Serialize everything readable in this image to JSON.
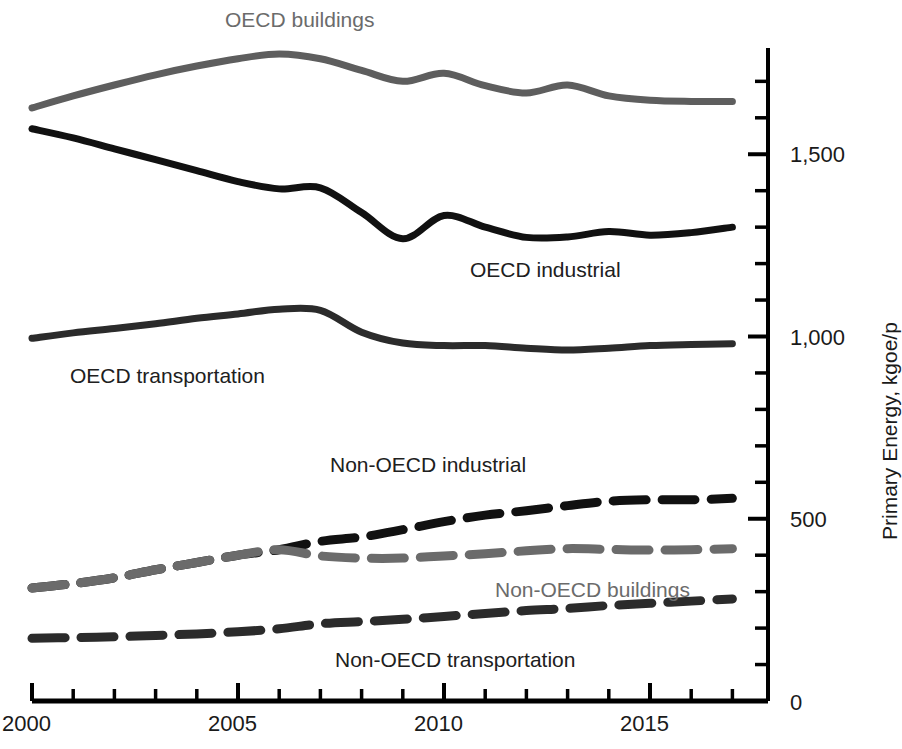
{
  "chart_data": {
    "type": "line",
    "title": "",
    "subtitle": "",
    "xlabel": "",
    "ylabel": "Primary Energy, kgoe/p",
    "xlim": [
      2000,
      2017
    ],
    "ylim": [
      0,
      1800
    ],
    "grid": false,
    "legend_position": "inline-labels",
    "y_tick_labels": [
      "0",
      "500",
      "1,000",
      "1,500"
    ],
    "y_tick_values": [
      0,
      500,
      1000,
      1500
    ],
    "y_minor_tick_interval": 100,
    "x_tick_labels": [
      "2000",
      "2005",
      "2010",
      "2015"
    ],
    "x_tick_values": [
      2000,
      2005,
      2010,
      2015
    ],
    "x_minor_tick_interval": 1,
    "x": [
      2000,
      2001,
      2002,
      2003,
      2004,
      2005,
      2006,
      2007,
      2008,
      2009,
      2010,
      2011,
      2012,
      2013,
      2014,
      2015,
      2016,
      2017
    ],
    "series": [
      {
        "name": "OECD buildings",
        "color": "#5e5e5e",
        "style": "solid",
        "label_x": 225,
        "label_y": 20,
        "values": [
          1627,
          1660,
          1690,
          1718,
          1742,
          1762,
          1775,
          1762,
          1730,
          1700,
          1722,
          1688,
          1668,
          1690,
          1660,
          1648,
          1645,
          1645
        ]
      },
      {
        "name": "OECD industrial",
        "color": "#111111",
        "style": "solid",
        "label_x": 554,
        "label_y": 270,
        "values": [
          1570,
          1545,
          1515,
          1485,
          1455,
          1425,
          1405,
          1408,
          1340,
          1268,
          1332,
          1300,
          1272,
          1273,
          1288,
          1278,
          1285,
          1300
        ]
      },
      {
        "name": "OECD transportation",
        "color": "#2b2b2b",
        "style": "solid",
        "label_x": 175,
        "label_y": 376,
        "values": [
          995,
          1010,
          1022,
          1035,
          1050,
          1062,
          1075,
          1072,
          1012,
          982,
          975,
          975,
          968,
          963,
          968,
          975,
          978,
          980
        ]
      },
      {
        "name": "Non-OECD industrial",
        "color": "#111111",
        "style": "dashed",
        "label_x": 440,
        "label_y": 466,
        "values": [
          310,
          322,
          338,
          360,
          380,
          400,
          415,
          438,
          450,
          470,
          492,
          510,
          522,
          536,
          548,
          552,
          552,
          556
        ]
      },
      {
        "name": "Non-OECD buildings",
        "color": "#6b6b6b",
        "style": "dashed",
        "label_x": 612,
        "label_y": 591,
        "values": [
          310,
          322,
          338,
          360,
          380,
          400,
          415,
          398,
          392,
          392,
          398,
          404,
          412,
          418,
          416,
          414,
          415,
          418
        ]
      },
      {
        "name": "Non-OECD transportation",
        "color": "#2b2b2b",
        "style": "dashed",
        "label_x": 488,
        "label_y": 660,
        "values": [
          172,
          174,
          176,
          180,
          184,
          190,
          198,
          212,
          218,
          224,
          232,
          240,
          248,
          254,
          262,
          268,
          274,
          280
        ]
      }
    ]
  },
  "axes": {
    "y_axis_title": "Primary Energy, kgoe/p",
    "y_labels": [
      {
        "text": "1,500",
        "x": 790,
        "y": 142
      },
      {
        "text": "1,000",
        "x": 790,
        "y": 325
      },
      {
        "text": "500",
        "x": 790,
        "y": 507
      },
      {
        "text": "0",
        "x": 790,
        "y": 690
      }
    ],
    "x_labels": [
      {
        "text": "2000",
        "x": 2,
        "y": 711
      },
      {
        "text": "2005",
        "x": 208,
        "y": 711
      },
      {
        "text": "2010",
        "x": 414,
        "y": 711
      },
      {
        "text": "2015",
        "x": 620,
        "y": 711
      }
    ]
  },
  "geometry": {
    "x_origin_px": 32,
    "x_per_year_px": 41.2,
    "y_zero_px": 701,
    "y_per_unit_px": 0.3645,
    "axis_x_px": 768,
    "axis_top_px": 48
  }
}
